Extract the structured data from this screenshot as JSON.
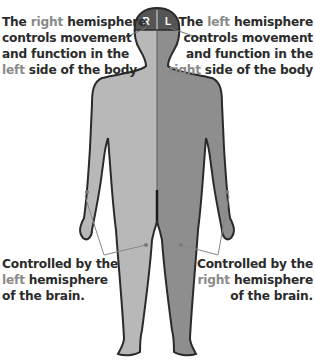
{
  "figure": {
    "head_labels": {
      "left_half": "R",
      "right_half": "L"
    },
    "colors": {
      "body_left_light": "#b8b8b8",
      "body_right_dark": "#8e8e8e",
      "outline": "#2a2a2a",
      "head_fill": "#555555",
      "highlight_text": "#8a8a8a",
      "body_text": "#2b2b2b"
    }
  },
  "callouts": {
    "top_left": {
      "line1_pre": "The ",
      "line1_hl": "right",
      "line1_post": " hemisphere",
      "line2": "controls movement",
      "line3": "and function in the",
      "line4_hl": "left",
      "line4_post": " side of the body"
    },
    "top_right": {
      "line1_pre": "The ",
      "line1_hl": "left",
      "line1_post": " hemisphere",
      "line2": "controls movement",
      "line3": "and function in the",
      "line4_hl": "right",
      "line4_post": " side of the body"
    },
    "bottom_left": {
      "line1": "Controlled by the",
      "line2_hl": "left",
      "line2_post": " hemisphere",
      "line3": "of the brain."
    },
    "bottom_right": {
      "line1": "Controlled by the",
      "line2_hl": "right",
      "line2_post": " hemisphere",
      "line3": "of the brain."
    }
  }
}
